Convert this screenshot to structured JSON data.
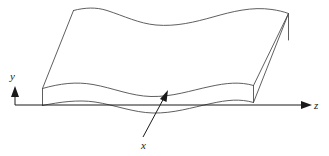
{
  "figure": {
    "background_color": "#ffffff",
    "line_color": "#4d4d4d",
    "axis_color": "#1a1a1a",
    "width": 329,
    "height": 156
  },
  "axes": {
    "y": {
      "label": "y",
      "orientation": "vertical-up",
      "label_x": 13,
      "label_y": 80,
      "line": {
        "x1": 15,
        "y1": 105,
        "x2": 15,
        "y2": 91
      },
      "arrow_tip": {
        "x": 15,
        "y": 86
      }
    },
    "z": {
      "label": "z",
      "orientation": "horizontal-right",
      "label_x": 314,
      "label_y": 109,
      "line": {
        "x1": 15,
        "y1": 105,
        "x2": 306,
        "y2": 105
      },
      "arrow_tip": {
        "x": 312,
        "y": 105
      }
    },
    "x": {
      "label": "x",
      "orientation": "into-page-callout",
      "label_x": 146,
      "label_y": 147,
      "leader_line": {
        "x1": 143,
        "y1": 137,
        "x2": 166,
        "y2": 95
      },
      "arrow_tip": {
        "x": 168,
        "y": 91
      }
    }
  },
  "surface": {
    "description": "corrugated wavy sheet drawn in oblique projection",
    "top_surface_path": "M 73.5 10.5 C 85 7.5 96 7 107 10.5 C 124 16 139 23.5 156 25 C 176 26.8 195 22 213 17 C 232 11.6 252 6.5 272 9.5 C 278 10.4 283.5 11.6 288.5 13.5",
    "front_upper_wave_path": "M 42.5 88.5 C 60 83.5 76 81.5 93 84.5 C 113 88 131 96 151 96.5 C 172 97 191 90.5 210 86.5 C 226 83 240 81.5 253.5 85.5",
    "front_lower_wave_path": "M 42.5 105.5 C 60 102 78 99.5 95 102 C 115 105 133 112.5 153 113 C 173 113.5 192 107.5 211 103.5 C 227 100 240 98.5 253.5 102.5",
    "left_edge_path": "M 42.5 88.5 L 73.5 10.5",
    "left_vertical_edge_path": "M 42.5 88.5 L 42.5 105.5",
    "right_edge_top_path": "M 253.5 85.5 L 288.5 13.5",
    "right_edge_inner_path": "M 253.5 102.5 L 288.5 13.5",
    "right_vertical_edge_path": "M 253.5 85.5 L 253.5 102.5",
    "right_far_edge_path": "M 288.5 13.5 L 288.5 40"
  }
}
